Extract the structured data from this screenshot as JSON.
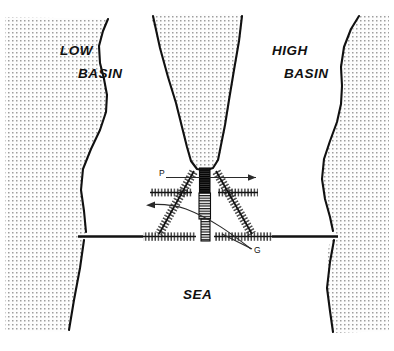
{
  "figure": {
    "type": "schematic-diagram",
    "background_color": "#ffffff",
    "line_color": "#111111",
    "land_fill_color": "#f2f2f2",
    "stipple_color": "#9a9a9a"
  },
  "labels": {
    "low_basin": "LOW\nBASIN",
    "low_basin_line1": "LOW",
    "low_basin_line2": "BASIN",
    "high_basin_line1": "HIGH",
    "high_basin_line2": "BASIN",
    "sea": "SEA",
    "structure_p": "P",
    "structure_g": "G"
  },
  "regions": [
    {
      "name": "low-basin",
      "label": "LOW BASIN",
      "fill": "stipple",
      "side": "left"
    },
    {
      "name": "high-basin",
      "label": "HIGH BASIN",
      "fill": "stipple",
      "side": "right"
    },
    {
      "name": "estuary-channel",
      "label": "",
      "fill": "stipple",
      "side": "center-top"
    },
    {
      "name": "sea",
      "label": "SEA",
      "fill": "white",
      "side": "bottom"
    }
  ],
  "annotations": [
    {
      "name": "arrow-right-p",
      "direction": "right",
      "description": "flow arrow at P level pointing right"
    },
    {
      "name": "arrow-left-g",
      "direction": "left",
      "description": "flow arrow on curved leader pointing left"
    },
    {
      "name": "leader-g",
      "description": "curved leader line from label G sweeping up-left"
    }
  ],
  "structures": [
    {
      "name": "barrier-p",
      "label": "P",
      "symbol": "hatched-band",
      "orientation": "vertical"
    },
    {
      "name": "barrier-g",
      "label": "G",
      "symbol": "hatched-band",
      "orientation": "vertical"
    },
    {
      "name": "dike-upper-left",
      "symbol": "ticked-line"
    },
    {
      "name": "dike-upper-right",
      "symbol": "ticked-line"
    },
    {
      "name": "dike-mid-horizontal",
      "symbol": "ticked-line"
    },
    {
      "name": "dike-diagonal-left",
      "symbol": "ticked-line"
    },
    {
      "name": "dike-diagonal-right",
      "symbol": "ticked-line"
    },
    {
      "name": "coastline-bottom",
      "symbol": "solid-and-ticked-line"
    }
  ]
}
